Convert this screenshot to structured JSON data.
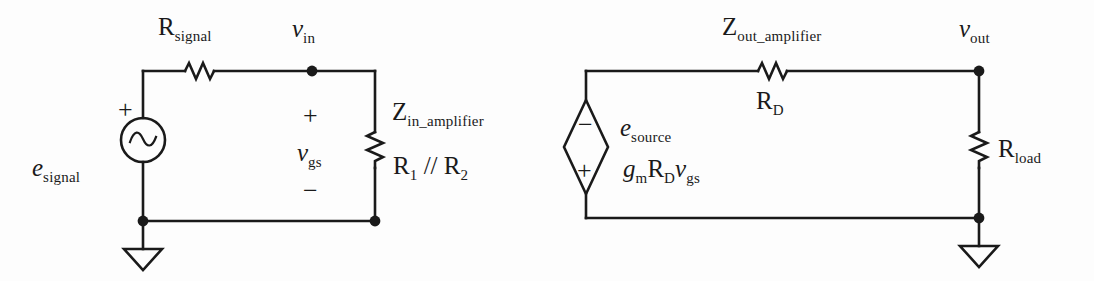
{
  "figure": {
    "stroke_color": "#1a1a1a",
    "background_color": "#fdfdfd"
  },
  "input_network": {
    "source_label_base": "e",
    "source_label_sub": "signal",
    "source_polarity": "+",
    "source_icon": "ac-voltage-source-icon",
    "series_resistor_base": "R",
    "series_resistor_sub": "signal",
    "node_label_base": "v",
    "node_label_sub": "in",
    "branch_voltage_base": "v",
    "branch_voltage_sub": "gs",
    "branch_plus": "+",
    "branch_minus": "−",
    "shunt_impedance_base": "Z",
    "shunt_impedance_sub": "in_amplifier",
    "shunt_value_r1_base": "R",
    "shunt_value_r1_sub": "1",
    "shunt_value_operator": " // ",
    "shunt_value_r2_base": "R",
    "shunt_value_r2_sub": "2",
    "ground_icon": "ground-icon"
  },
  "output_network": {
    "source_label_base": "e",
    "source_label_sub": "source",
    "source_icon": "dependent-voltage-source-icon",
    "source_top_polarity": "−",
    "source_bottom_polarity": "+",
    "source_value_gm_base": "g",
    "source_value_gm_sub": "m",
    "source_value_rd_base": "R",
    "source_value_rd_sub": "D",
    "source_value_vgs_base": "v",
    "source_value_vgs_sub": "gs",
    "series_impedance_base": "Z",
    "series_impedance_sub": "out_amplifier",
    "series_value_base": "R",
    "series_value_sub": "D",
    "node_label_base": "v",
    "node_label_sub": "out",
    "load_resistor_base": "R",
    "load_resistor_sub": "load",
    "ground_icon": "ground-icon"
  }
}
